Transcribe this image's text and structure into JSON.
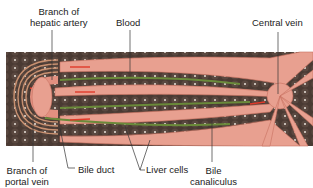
{
  "diagram": {
    "type": "anatomical-illustration",
    "colors": {
      "tissue": "#4a3a33",
      "cell_nucleus": "#e8e0d8",
      "blood": "#e8a090",
      "blood_flow_arrow": "#e03a2a",
      "bile": "#6a8a3a",
      "artery_rings": "#c89070",
      "leader_line": "#333333"
    },
    "labels": {
      "hepatic_artery": [
        "Branch of",
        "hepatic artery"
      ],
      "blood": "Blood",
      "central_vein": "Central vein",
      "portal_vein": [
        "Branch of",
        "portal vein"
      ],
      "bile_duct": "Bile duct",
      "liver_cells": "Liver cells",
      "bile_canaliculus": [
        "Bile",
        "canaliculus"
      ]
    }
  }
}
